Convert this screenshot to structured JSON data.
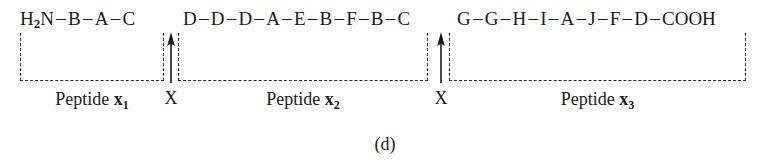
{
  "figure": {
    "caption": "(d)",
    "type": "peptide-cleavage-diagram"
  },
  "sequence": {
    "n_terminus": "H",
    "n_terminus_sub": "2",
    "n_terminus_tail": "N",
    "c_terminus": "COOH",
    "bond_dash": "–",
    "segments": [
      {
        "id": "peptide-1",
        "residues": [
          "B",
          "A",
          "C"
        ],
        "label_prefix": "Peptide",
        "label_var": "x",
        "label_sub": "1"
      },
      {
        "id": "peptide-2",
        "residues": [
          "D",
          "D",
          "D",
          "A",
          "E",
          "B",
          "F",
          "B",
          "C"
        ],
        "label_prefix": "Peptide",
        "label_var": "x",
        "label_sub": "2"
      },
      {
        "id": "peptide-3",
        "residues": [
          "G",
          "G",
          "H",
          "I",
          "A",
          "J",
          "F",
          "D"
        ],
        "label_prefix": "Peptide",
        "label_var": "x",
        "label_sub": "3"
      }
    ]
  },
  "cleavage_sites": [
    {
      "id": "site-1",
      "label": "X"
    },
    {
      "id": "site-2",
      "label": "X"
    }
  ],
  "colors": {
    "ink": "#1a1a1a",
    "bracket": "#2b2b2b",
    "background": "#ffffff"
  }
}
